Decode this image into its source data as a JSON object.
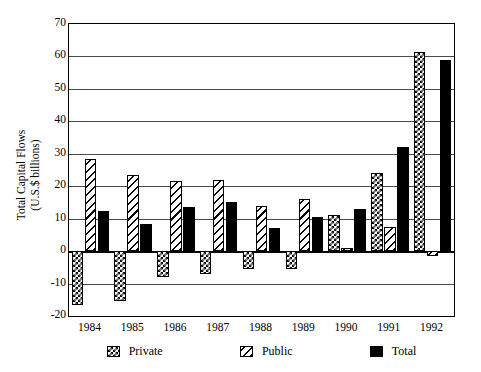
{
  "chart_data": {
    "type": "bar",
    "title": "",
    "xlabel": "",
    "ylabel": "Total Capital Flows\n(U.S.$ billions)",
    "ylabel_line1": "Total Capital Flows",
    "ylabel_line2": "(U.S.$ billions)",
    "categories": [
      "1984",
      "1985",
      "1986",
      "1987",
      "1988",
      "1989",
      "1990",
      "1991",
      "1992"
    ],
    "series": [
      {
        "name": "Private",
        "pattern": "checkerboard",
        "values": [
          -16.5,
          -15.5,
          -8,
          -7,
          -5.5,
          -5.5,
          11,
          24,
          61.5
        ]
      },
      {
        "name": "Public",
        "pattern": "diagonal-hatch",
        "values": [
          28.5,
          23.5,
          21.5,
          22,
          14,
          16,
          1,
          7.5,
          -1.5
        ]
      },
      {
        "name": "Total",
        "pattern": "solid-black",
        "values": [
          12.5,
          8.5,
          13.5,
          15,
          7,
          10.5,
          13,
          32,
          59
        ]
      }
    ],
    "ylim": [
      -20,
      70
    ],
    "yticks": [
      -20,
      -10,
      0,
      10,
      20,
      30,
      40,
      50,
      60,
      70
    ],
    "ytick_labels": [
      "-20",
      "-10",
      "0",
      "10",
      "20",
      "30",
      "40",
      "50",
      "60",
      "70"
    ],
    "grid": true,
    "grid_axis": "y",
    "legend_position": "bottom",
    "legend_entries": [
      "Private",
      "Public",
      "Total"
    ],
    "colors": {
      "foreground": "#000000",
      "background": "#ffffff",
      "gridline": "#4a4a4a"
    }
  }
}
